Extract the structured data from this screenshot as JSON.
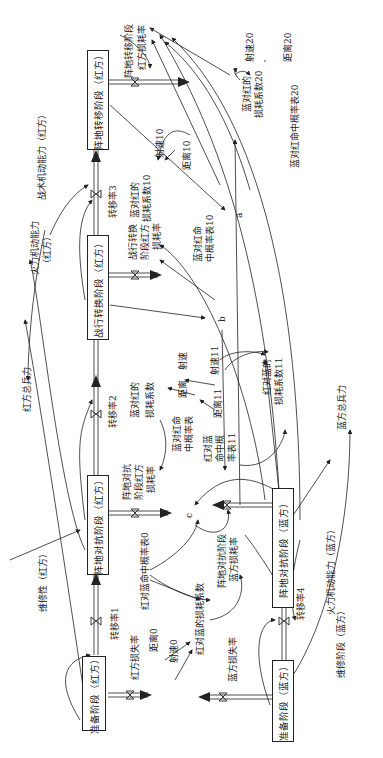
{
  "diagram": {
    "type": "system-dynamics stock-flow diagram (rotated 90°)",
    "stocks": {
      "red_prep": "准备阶段（红方）",
      "red_confront": "阵地对抗阶段（红方）",
      "red_convert": "战行转换阶段（红方）",
      "red_transfer": "阵地转移阶段（红方）",
      "blue_prep": "准备阶段（蓝方）",
      "blue_confront": "阵地对抗阶段（蓝方）"
    },
    "flows": {
      "rate1": "转移率1",
      "rate2": "转移率2",
      "rate3": "转移率3",
      "rate4": "转移率4",
      "red_loss": "红方损失率",
      "blue_loss": "蓝方损失率",
      "transfer_loss": "阵地转移阶段红方损耗率",
      "transfer_loss_l1": "阵地转移阶段",
      "transfer_loss_l2": "红方损耗率"
    },
    "variables": {
      "maint_red": "维修性（红方）",
      "maint_blue": "维修阶段（蓝方）",
      "tactic_mobility_red": "战术机动能力（红方）",
      "fire_mobility_red_l1": "火力机动能力",
      "fire_mobility_red_l2": "（红方）",
      "fire_mobility_blue": "火力机动能力（蓝方）",
      "red_total": "红方总兵力",
      "blue_total": "蓝方总兵力",
      "speed0": "射速0",
      "dist0": "距离0",
      "hit_red_blue0": "红对蓝命中概率表0",
      "coef_red_blue0": "红对蓝的损耗系数",
      "confront_blue_loss_l1": "阵地对抗阶段",
      "confront_blue_loss_l2": "蓝方损耗率",
      "confront_red_loss_l1": "阵地对抗",
      "confront_red_loss_l2": "阶段红方",
      "confront_red_loss_l3": "损耗率",
      "c": "c",
      "coef_blue_red_l1": "蓝对红的",
      "coef_blue_red_l2": "损耗系数",
      "dist": "距离",
      "speed": "射速",
      "hit_blue_red_l1": "蓝对红命",
      "hit_blue_red_l2": "中概率表",
      "hit_red_blue11_l1": "红对蓝",
      "hit_red_blue11_l2": "命中概",
      "hit_red_blue11_l3": "率表11",
      "speed11": "射速11",
      "dist11": "距离11",
      "coef_red_blue11_l1": "红对蓝的",
      "coef_red_blue11_l2": "损耗系数11",
      "b": "b",
      "convert_loss_l1": "战行转换",
      "convert_loss_l2": "阶段红方",
      "convert_loss_l3": "损耗率",
      "hit_blue_red10_l1": "蓝对红命",
      "hit_blue_red10_l2": "中概率表10",
      "coef_blue_red10_l1": "蓝对红的",
      "coef_blue_red10_l2": "损耗系数10",
      "dist10": "距离10",
      "speed10": "射速10",
      "a": "a",
      "speed20": "射速20",
      "dist20": "距离20",
      "coef_blue_red20_l1": "蓝对红的",
      "coef_blue_red20_l2": "损耗系数20",
      "hit_blue_red20": "蓝对红命中概率表20"
    }
  }
}
